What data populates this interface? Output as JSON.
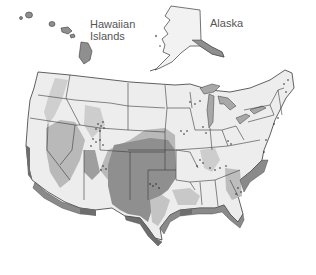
{
  "map": {
    "title": "",
    "insets": {
      "hawaii": {
        "label_line1": "Hawaiian",
        "label_line2": "Islands"
      },
      "alaska": {
        "label": "Alaska"
      }
    },
    "colors": {
      "land_light": "#ededed",
      "zone_medium": "#b9b9b9",
      "zone_dark": "#8f8f8f",
      "coast_darkest": "#6e6e6e",
      "border": "#3a3a3a",
      "lakes": "#a8a8a8",
      "background": "#ffffff"
    },
    "legend": []
  }
}
